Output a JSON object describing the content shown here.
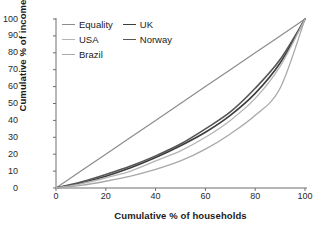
{
  "chart_data": {
    "type": "line",
    "title": "",
    "xlabel": "Cumulative % of households",
    "ylabel": "Cumulative % of income",
    "xlim": [
      0,
      100
    ],
    "ylim": [
      0,
      100
    ],
    "xticks": [
      0,
      20,
      40,
      60,
      80,
      100
    ],
    "yticks": [
      0,
      10,
      20,
      30,
      40,
      50,
      60,
      70,
      80,
      90,
      100
    ],
    "grid": false,
    "legend_position": "upper-left-inside",
    "x": [
      0,
      10,
      20,
      30,
      40,
      50,
      60,
      70,
      80,
      90,
      100
    ],
    "series": [
      {
        "name": "Equality",
        "color": "#8c8c8c",
        "width": 1.2,
        "values": [
          0,
          10,
          20,
          30,
          40,
          50,
          60,
          70,
          80,
          90,
          100
        ]
      },
      {
        "name": "UK",
        "color": "#3d3d3d",
        "width": 1.6,
        "values": [
          0,
          3,
          7,
          12,
          18,
          25,
          33,
          43,
          56,
          74,
          100
        ]
      },
      {
        "name": "Norway",
        "color": "#555555",
        "width": 1.6,
        "values": [
          0,
          3.5,
          8,
          13,
          19,
          26,
          35,
          45,
          59,
          76,
          100
        ]
      },
      {
        "name": "USA",
        "color": "#b4b4b4",
        "width": 1.3,
        "values": [
          0,
          2.5,
          6,
          10,
          16,
          22,
          30,
          40,
          53,
          72,
          100
        ]
      },
      {
        "name": "Brazil",
        "color": "#a8a8a8",
        "width": 1.3,
        "values": [
          0,
          1.5,
          4,
          7,
          11,
          16,
          23,
          32,
          43,
          59,
          100
        ]
      }
    ]
  },
  "axes": {
    "x_label": "Cumulative % of households",
    "y_label": "Cumulative % of income",
    "x_ticks": [
      "0",
      "20",
      "40",
      "60",
      "80",
      "100"
    ],
    "y_ticks": [
      "0",
      "10",
      "20",
      "30",
      "40",
      "50",
      "60",
      "70",
      "80",
      "90",
      "100"
    ],
    "axis_color": "#6e6e6e"
  },
  "legend": {
    "entries": [
      {
        "label": "Equality",
        "color": "#8c8c8c",
        "width": 1.2
      },
      {
        "label": "UK",
        "color": "#3d3d3d",
        "width": 1.6
      },
      {
        "label": "USA",
        "color": "#b4b4b4",
        "width": 1.3
      },
      {
        "label": "Norway",
        "color": "#555555",
        "width": 1.6
      },
      {
        "label": "Brazil",
        "color": "#a8a8a8",
        "width": 1.3
      }
    ]
  }
}
